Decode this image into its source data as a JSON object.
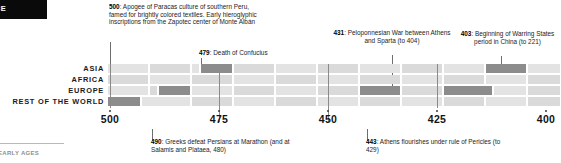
{
  "corner": {
    "label": "CE"
  },
  "rows": [
    {
      "label": "ASIA"
    },
    {
      "label": "AFRICA"
    },
    {
      "label": "EUROPE"
    },
    {
      "label": "REST OF THE WORLD"
    }
  ],
  "axis": {
    "ticks": [
      "500",
      "475",
      "450",
      "425",
      "400"
    ]
  },
  "annotations": [
    {
      "id": "annot-500",
      "year": "500",
      "text": "500: Apogee of Paracas culture of southern Peru, famed for brightly colored textiles. Early hieroglyphic inscriptions from the Zapotec center of Monte Albán",
      "position": "above"
    },
    {
      "id": "annot-479",
      "year": "479",
      "text": "479: Death of Confucius",
      "position": "above"
    },
    {
      "id": "annot-431",
      "year": "431",
      "text": "431: Peloponnesian War between Athens and Sparta (to 404)",
      "position": "above"
    },
    {
      "id": "annot-403",
      "year": "403",
      "text": "403: Beginning of Warring States period in China (to 221)",
      "position": "above"
    },
    {
      "id": "annot-490",
      "year": "490",
      "text": "490: Greeks defeat Persians at Marathon (and at Salamis and Plataea, 480)",
      "position": "below"
    },
    {
      "id": "annot-443",
      "year": "443",
      "text": "443: Athens flourishes under rule of Pericles (to 429)",
      "position": "below"
    }
  ],
  "chart_data": {
    "type": "timeline",
    "title": "",
    "xlabel": "",
    "ylabel": "",
    "x_axis_direction": "descending BCE",
    "xlim": [
      505,
      396
    ],
    "tick_values": [
      500,
      475,
      450,
      425,
      400
    ],
    "row_categories": [
      "ASIA",
      "AFRICA",
      "EUROPE",
      "REST OF THE WORLD"
    ],
    "grid": true,
    "legend": "none",
    "events": [
      {
        "row": "REST OF THE WORLD",
        "year": 500,
        "label": "Apogee of Paracas culture of southern Peru, famed for brightly colored textiles. Early hieroglyphic inscriptions from the Zapotec center of Monte Albán",
        "highlighted": true
      },
      {
        "row": "EUROPE",
        "year": 490,
        "label": "Greeks defeat Persians at Marathon (and at Salamis and Plataea, 480)",
        "highlighted": true
      },
      {
        "row": "ASIA",
        "year": 479,
        "label": "Death of Confucius",
        "highlighted": true
      },
      {
        "row": "EUROPE",
        "year": 443,
        "label": "Athens flourishes under rule of Pericles (to 429)",
        "highlighted": true
      },
      {
        "row": "EUROPE",
        "year": 431,
        "label": "Peloponnesian War between Athens and Sparta (to 404)",
        "highlighted": true
      },
      {
        "row": "ASIA",
        "year": 403,
        "label": "Beginning of Warring States period in China (to 221)",
        "highlighted": true
      }
    ],
    "colors": {
      "cell_empty": "#e3e3e3",
      "cell_empty_alt": "#dadada",
      "cell_event": "#8c8c8c",
      "leader_line": "#6e6e6e",
      "text": "#1c1c1c",
      "header_tab": "#0a0a0a"
    }
  },
  "footer": {
    "text": "EARLY AGES"
  }
}
